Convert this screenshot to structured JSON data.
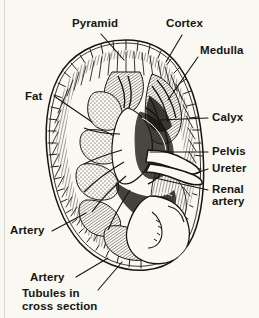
{
  "figure": {
    "background_color": "#faf8f2",
    "ink_color": "#17150f",
    "style": "engraved pen-and-ink hatching"
  },
  "labels": [
    {
      "id": "pyramid",
      "text": "Pyramid",
      "x": 72,
      "y": 17,
      "leader": "down-right"
    },
    {
      "id": "cortex",
      "text": "Cortex",
      "x": 166,
      "y": 17,
      "leader": "down-left"
    },
    {
      "id": "medulla",
      "text": "Medulla",
      "x": 200,
      "y": 44,
      "leader": "down-left"
    },
    {
      "id": "fat",
      "text": "Fat",
      "x": 25,
      "y": 90,
      "leader": "right-down"
    },
    {
      "id": "calyx",
      "text": "Calyx",
      "x": 212,
      "y": 111,
      "leader": "left"
    },
    {
      "id": "pelvis",
      "text": "Pelvis",
      "x": 212,
      "y": 145,
      "leader": "left"
    },
    {
      "id": "ureter",
      "text": "Ureter",
      "x": 212,
      "y": 162,
      "leader": "left"
    },
    {
      "id": "renal-artery-l1",
      "text": "Renal",
      "x": 212,
      "y": 183,
      "leader": "left"
    },
    {
      "id": "renal-artery-l2",
      "text": "artery",
      "x": 212,
      "y": 195,
      "leader": "none"
    },
    {
      "id": "artery-upper",
      "text": "Artery",
      "x": 10,
      "y": 224,
      "leader": "right-up"
    },
    {
      "id": "artery-lower",
      "text": "Artery",
      "x": 30,
      "y": 271,
      "leader": "right-up"
    },
    {
      "id": "tubules-l1",
      "text": "Tubules in",
      "x": 22,
      "y": 287,
      "leader": "right-up"
    },
    {
      "id": "tubules-l2",
      "text": "cross section",
      "x": 22,
      "y": 300,
      "leader": "none"
    }
  ],
  "structures": [
    "renal capsule",
    "perirenal fat",
    "cortex with radial striations",
    "renal pyramids",
    "medulla",
    "minor calyx",
    "renal pelvis",
    "ureter",
    "renal artery",
    "interlobar arteries",
    "tubules in cross section"
  ]
}
